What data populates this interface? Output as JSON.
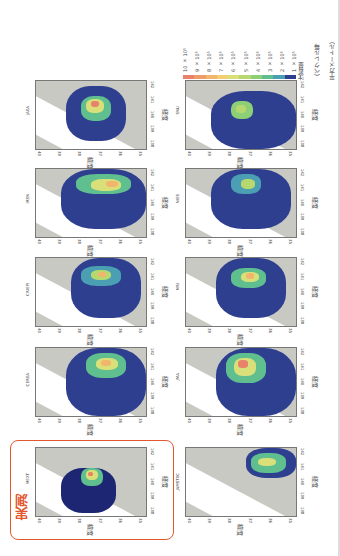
{
  "figure": {
    "highlight_label": "実測",
    "axis_labels": {
      "latitude": "緯度",
      "longitude": "経度"
    },
    "lat_ticks": [
      "40",
      "39",
      "38",
      "37",
      "36",
      "35"
    ],
    "lon_ticks": [
      "142",
      "141",
      "140",
      "139",
      "138"
    ],
    "panels": [
      {
        "id": "JAEA",
        "title": "JAEA"
      },
      {
        "id": "IRSN",
        "title": "IRSN"
      },
      {
        "id": "CRIEPI",
        "title": "CRIEPI"
      },
      {
        "id": "CEREA",
        "title": "CEREA"
      },
      {
        "id": "MEXT",
        "title": "MEXT"
      },
      {
        "id": "SNU",
        "title": "SNU"
      },
      {
        "id": "NIES",
        "title": "NIES"
      },
      {
        "id": "MRI",
        "title": "MRI"
      },
      {
        "id": "JMA",
        "title": "JMA"
      },
      {
        "id": "JAMSTEC",
        "title": "JAMSTEC"
      }
    ],
    "colorbar": {
      "labels": [
        "10 × 10⁵",
        "9 × 10⁵",
        "8 × 10⁵",
        "7 × 10⁵",
        "6 × 10⁵",
        "5 × 10⁵",
        "4 × 10⁵",
        "3 × 10⁵",
        "2 × 10⁵",
        "1 × 10⁵"
      ],
      "colors": [
        "#e8826a",
        "#ef9c6a",
        "#f2b56c",
        "#f0d070",
        "#d9e07a",
        "#b7d86e",
        "#8ccf77",
        "#5fbf8f",
        "#4a9fb2",
        "#2e3f8f",
        "#1c2672"
      ],
      "unit_lines": [
        "沈着量",
        "（ベクレル毎",
        "平方メートル）"
      ]
    }
  },
  "chart_data": {
    "type": "heatmap",
    "title": "",
    "xlabel": "経度",
    "ylabel": "緯度",
    "x_ticks": [
      138,
      139,
      140,
      141,
      142
    ],
    "y_ticks": [
      35,
      36,
      37,
      38,
      39,
      40
    ],
    "xlim": [
      138,
      142
    ],
    "ylim": [
      35,
      40
    ],
    "panels": [
      "MEXT",
      "JAMSTEC",
      "CEREA",
      "JMA",
      "CRIEPI",
      "MRI",
      "IRSN",
      "NIES",
      "JAEA",
      "SNU"
    ],
    "measured_panel": "MEXT",
    "colorbar": {
      "label": "沈着量（ベクレル毎平方メートル）",
      "levels": [
        100000,
        200000,
        300000,
        400000,
        500000,
        600000,
        700000,
        800000,
        900000,
        1000000
      ],
      "tick_labels": [
        "1 × 10⁵",
        "2 × 10⁵",
        "3 × 10⁵",
        "4 × 10⁵",
        "5 × 10⁵",
        "6 × 10⁵",
        "7 × 10⁵",
        "8 × 10⁵",
        "9 × 10⁵",
        "10 × 10⁵"
      ]
    }
  }
}
